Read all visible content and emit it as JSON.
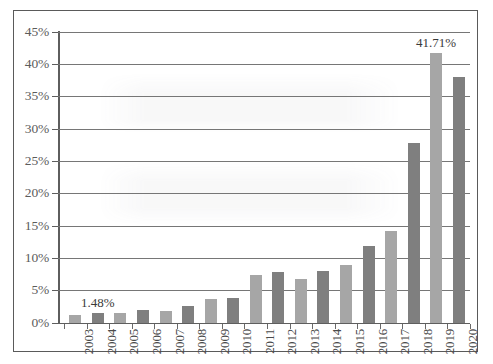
{
  "chart_data": {
    "type": "bar",
    "title": "",
    "subtitle": "",
    "xlabel": "",
    "ylabel": "",
    "ylim": [
      0,
      45
    ],
    "ytick_values": [
      0,
      5,
      10,
      15,
      20,
      25,
      30,
      35,
      40,
      45
    ],
    "ytick_labels": [
      "0%",
      "5%",
      "10%",
      "15%",
      "20%",
      "25%",
      "30%",
      "35%",
      "40%",
      "45%"
    ],
    "grid": true,
    "legend": null,
    "legend_position": "none",
    "categories": [
      "2003",
      "2004",
      "2005",
      "2006",
      "2007",
      "2008",
      "2009",
      "2010",
      "2011",
      "2012",
      "2013",
      "2014",
      "2015",
      "2016",
      "2017",
      "2018",
      "2019",
      "2020"
    ],
    "values": [
      1.1,
      1.48,
      1.5,
      1.9,
      1.8,
      2.6,
      3.7,
      3.8,
      7.3,
      7.8,
      6.8,
      7.9,
      8.9,
      11.9,
      14.1,
      27.7,
      41.71,
      37.9
    ],
    "bar_colors": [
      "light",
      "dark",
      "light",
      "dark",
      "light",
      "dark",
      "light",
      "dark",
      "light",
      "dark",
      "light",
      "dark",
      "light",
      "dark",
      "light",
      "dark",
      "light",
      "dark"
    ],
    "annotations": [
      {
        "category": "2004",
        "text": "1.48%"
      },
      {
        "category": "2019",
        "text": "41.71%"
      }
    ],
    "colors": {
      "light_bar": "#a6a6a6",
      "dark_bar": "#7f7f7f",
      "gridline": "#767676",
      "axis": "#5e5e5e",
      "axis_text": "#5c5c5c",
      "label_text": "#3a3a3a",
      "border": "#5a5a5a",
      "background": "#ffffff"
    }
  }
}
